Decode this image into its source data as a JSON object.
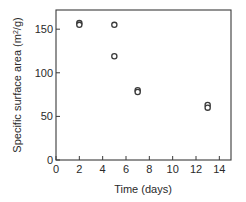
{
  "chart_data": {
    "type": "scatter",
    "title": "",
    "xlabel": "Time (days)",
    "ylabel": "Specific surface area (m²/g)",
    "ylabel_parts": {
      "main": "Specific surface area (m",
      "sup": "2",
      "tail": "/g)"
    },
    "xlim": [
      0,
      15
    ],
    "ylim": [
      0,
      172
    ],
    "xticks": [
      0,
      2,
      4,
      6,
      8,
      10,
      12,
      14
    ],
    "yticks": [
      0,
      50,
      100,
      150
    ],
    "grid": false,
    "legend": null,
    "marker": "open-circle",
    "series": [
      {
        "name": "Specific surface area",
        "points": [
          {
            "x": 2,
            "y": 157
          },
          {
            "x": 2,
            "y": 155
          },
          {
            "x": 5,
            "y": 155
          },
          {
            "x": 5,
            "y": 119
          },
          {
            "x": 7,
            "y": 80
          },
          {
            "x": 7,
            "y": 78
          },
          {
            "x": 13,
            "y": 63
          },
          {
            "x": 13,
            "y": 60
          }
        ]
      }
    ]
  },
  "colors": {
    "axis": "#3a3a3a",
    "marker": "#3a3a3a",
    "background": "#ffffff"
  }
}
